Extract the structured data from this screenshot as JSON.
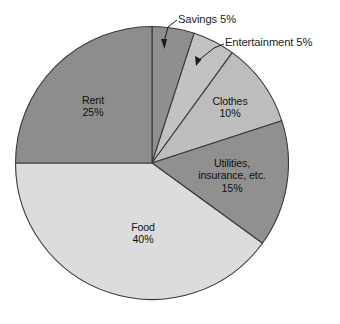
{
  "chart_data": {
    "type": "pie",
    "title": "",
    "subtitle": "",
    "xlabel": "",
    "ylabel": "",
    "grid": false,
    "legend_position": "none",
    "total": 100,
    "unit": "%",
    "start_angle_deg": 0,
    "direction": "clockwise",
    "categories": [
      "Savings",
      "Entertainment",
      "Clothes",
      "Utilities, insurance, etc.",
      "Food",
      "Rent"
    ],
    "values": [
      5,
      5,
      10,
      15,
      40,
      25
    ],
    "colors": [
      "#8f8f8f",
      "#c2c2c2",
      "#bdbdbd",
      "#909090",
      "#dcdcdc",
      "#8d8d8d"
    ],
    "slices": [
      {
        "name": "Savings",
        "value": 5,
        "color": "#8f8f8f",
        "label_placement": "outside",
        "label_text": "Savings 5%",
        "leader_line": true,
        "arrowhead": true
      },
      {
        "name": "Entertainment",
        "value": 5,
        "color": "#c2c2c2",
        "label_placement": "outside",
        "label_text": "Entertainment 5%",
        "leader_line": true,
        "arrowhead": true
      },
      {
        "name": "Clothes",
        "value": 10,
        "color": "#bdbdbd",
        "label_placement": "inside",
        "label_lines": [
          "Clothes",
          "10%"
        ],
        "leader_line": false,
        "arrowhead": false
      },
      {
        "name": "Utilities, insurance, etc.",
        "value": 15,
        "color": "#909090",
        "label_placement": "inside",
        "label_lines": [
          "Utilities,",
          "insurance, etc.",
          "15%"
        ],
        "leader_line": false,
        "arrowhead": false
      },
      {
        "name": "Food",
        "value": 40,
        "color": "#dcdcdc",
        "label_placement": "inside",
        "label_lines": [
          "Food",
          "40%"
        ],
        "leader_line": false,
        "arrowhead": false
      },
      {
        "name": "Rent",
        "value": 25,
        "color": "#8d8d8d",
        "label_placement": "inside",
        "label_lines": [
          "Rent",
          "25%"
        ],
        "leader_line": false,
        "arrowhead": false
      }
    ]
  },
  "labels": {
    "savings": "Savings 5%",
    "entertainment": "Entertainment 5%",
    "rent_name": "Rent",
    "rent_value": "25%",
    "clothes_name": "Clothes",
    "clothes_value": "10%",
    "utilities_line1": "Utilities,",
    "utilities_line2": "insurance, etc.",
    "utilities_value": "15%",
    "food_name": "Food",
    "food_value": "40%"
  },
  "style": {
    "background": "#ffffff",
    "outline": "#3a3a3a",
    "text": "#111111"
  }
}
